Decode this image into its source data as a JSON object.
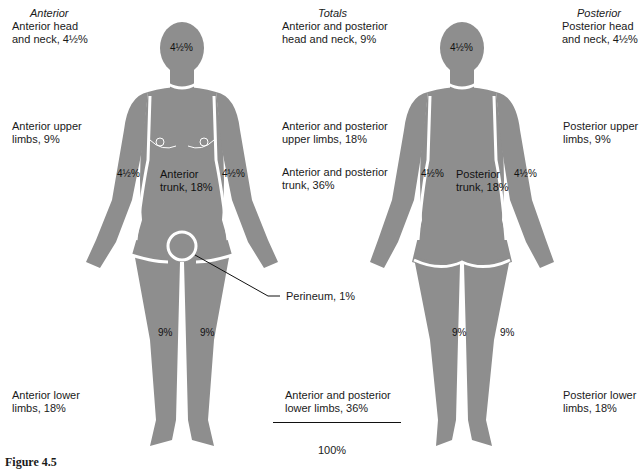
{
  "headings": {
    "anterior": "Anterior",
    "totals": "Totals",
    "posterior": "Posterior"
  },
  "anterior_labels": {
    "head_neck": "Anterior head\nand neck, 4½%",
    "upper_limbs": "Anterior upper\nlimbs, 9%",
    "lower_limbs": "Anterior lower\nlimbs, 18%"
  },
  "totals_labels": {
    "head_neck": "Anterior and posterior\nhead and neck, 9%",
    "upper_limbs": "Anterior and posterior\nupper limbs, 18%",
    "trunk": "Anterior and posterior\ntrunk, 36%",
    "lower_limbs": "Anterior and posterior\nlower limbs, 36%",
    "sum": "100%"
  },
  "posterior_labels": {
    "head_neck": "Posterior head\nand neck, 4½%",
    "upper_limbs": "Posterior upper\nlimbs, 9%",
    "lower_limbs": "Posterior lower\nlimbs, 18%"
  },
  "anterior_figure": {
    "head": "4½%",
    "left_arm": "4½%",
    "right_arm": "4½%",
    "trunk": "Anterior\ntrunk, 18%",
    "left_leg": "9%",
    "right_leg": "9%"
  },
  "perineum_callout": "Perineum, 1%",
  "posterior_figure": {
    "head": "4½%",
    "left_arm": "4½%",
    "right_arm": "4½%",
    "trunk": "Posterior\ntrunk, 18%",
    "left_leg": "9%",
    "right_leg": "9%"
  },
  "caption": "Figure 4.5",
  "colors": {
    "body_fill": "#8e8e8e",
    "outline": "#ffffff",
    "text": "#1a1a1a"
  }
}
